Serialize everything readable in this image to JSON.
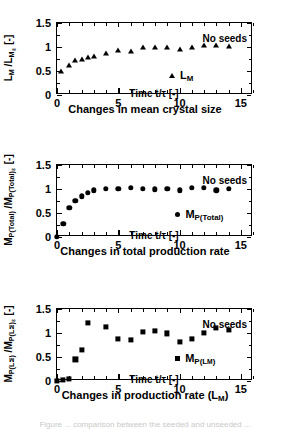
{
  "figure": {
    "width": 290,
    "height": 428,
    "background": "#ffffff",
    "ink_color": "#000000",
    "footnote_partial": "Figure ... comparison between the seeded and unseeded ..."
  },
  "chart_data": [
    {
      "id": "mean-crystal-size",
      "type": "scatter",
      "title": "",
      "caption": "Changes in mean crystal size",
      "xlabel": "Time  t/τ  [-]",
      "ylabel": "L_M /L_M∞ [-]",
      "ylabel_parts": {
        "num": "L",
        "num_sub": "M",
        "den": "L",
        "den_sub": "M∞",
        "units": "[-]"
      },
      "annotation": "No seeds",
      "legend": [
        {
          "label": "L_M",
          "marker": "triangle"
        }
      ],
      "legend_parts": {
        "base": "L",
        "sub": "M"
      },
      "marker": "triangle",
      "xlim": [
        0,
        16
      ],
      "ylim": [
        0,
        1.5
      ],
      "xticks": [
        0,
        5,
        10,
        15
      ],
      "xticklabels": [
        "0",
        "5",
        "10",
        "15"
      ],
      "xminor_step": 1,
      "yticks": [
        0,
        0.5,
        1,
        1.5
      ],
      "yticklabels": [
        "0",
        "0.5",
        "1",
        "1.5"
      ],
      "yminor_step": 0.25,
      "grid": false,
      "x": [
        0.35,
        1.0,
        1.5,
        2.0,
        2.5,
        3.0,
        4.0,
        5.0,
        6.0,
        7.0,
        8.0,
        9.0,
        10.0,
        11.0,
        12.0,
        13.0,
        14.0
      ],
      "y": [
        0.5,
        0.62,
        0.73,
        0.75,
        0.79,
        0.82,
        0.88,
        0.93,
        0.92,
        1.0,
        1.01,
        1.01,
        0.96,
        1.0,
        1.04,
        1.04,
        1.03
      ]
    },
    {
      "id": "total-production-rate",
      "type": "scatter",
      "title": "",
      "caption": "Changes in total production rate",
      "xlabel": "Time  t/τ  [-]",
      "ylabel": "M_P(Total) /M_P(Total)∞ [-]",
      "ylabel_parts": {
        "num": "M",
        "num_sub": "P(Total)",
        "den": "M",
        "den_sub": "P(Total)∞",
        "units": "[-]"
      },
      "annotation": "No seeds",
      "legend": [
        {
          "label": "M_P(Total)",
          "marker": "circle"
        }
      ],
      "legend_parts": {
        "base": "M",
        "sub": "P(Total)"
      },
      "marker": "circle",
      "xlim": [
        0,
        16
      ],
      "ylim": [
        0,
        1.5
      ],
      "xticks": [
        0,
        5,
        10,
        15
      ],
      "xticklabels": [
        "0",
        "5",
        "10",
        "15"
      ],
      "xminor_step": 1,
      "yticks": [
        0,
        0.5,
        1,
        1.5
      ],
      "yticklabels": [
        "0",
        "0.5",
        "1",
        "1.5"
      ],
      "yminor_step": 0.25,
      "grid": false,
      "x": [
        0.0,
        0.5,
        1.0,
        1.5,
        2.0,
        2.5,
        3.0,
        4.0,
        5.0,
        6.0,
        7.0,
        8.0,
        9.0,
        10.0,
        11.0,
        12.0,
        13.0,
        14.0
      ],
      "y": [
        0.0,
        0.28,
        0.61,
        0.75,
        0.85,
        0.92,
        0.97,
        1.0,
        1.0,
        1.02,
        1.0,
        0.99,
        1.0,
        0.97,
        1.03,
        1.02,
        0.97,
        1.01
      ]
    },
    {
      "id": "production-rate-lm",
      "type": "scatter",
      "title": "",
      "caption": "Changes in production rate (L_M)",
      "caption_parts": {
        "text": "Changes in production rate (L",
        "sub": "M",
        "tail": ")"
      },
      "xlabel": "Time  t/τ  [-]",
      "ylabel": "M_P(LM) /M_P(LM)∞ [-]",
      "ylabel_parts": {
        "num": "M",
        "num_sub": "P(LM)",
        "den": "M",
        "den_sub": "P(LM)∞",
        "units": "[-]"
      },
      "annotation": "No seeds",
      "legend": [
        {
          "label": "M_P(LM)",
          "marker": "square"
        }
      ],
      "legend_parts": {
        "base": "M",
        "sub": "P(L",
        "sub_tail": "M)"
      },
      "marker": "square",
      "xlim": [
        0,
        16
      ],
      "ylim": [
        0,
        1.5
      ],
      "xticks": [
        0,
        5,
        10,
        15
      ],
      "xticklabels": [
        "0",
        "5",
        "10",
        "15"
      ],
      "xminor_step": 1,
      "yticks": [
        0,
        0.5,
        1,
        1.5
      ],
      "yticklabels": [
        "0",
        "0.5",
        "1",
        "1.5"
      ],
      "yminor_step": 0.25,
      "grid": false,
      "x": [
        0.0,
        0.5,
        1.0,
        1.5,
        2.0,
        2.5,
        4.0,
        5.0,
        6.0,
        7.0,
        8.0,
        9.0,
        10.0,
        11.0,
        12.0,
        13.0,
        14.0
      ],
      "y": [
        0.01,
        0.03,
        0.05,
        0.45,
        0.65,
        1.21,
        1.13,
        0.88,
        0.85,
        1.02,
        1.04,
        0.99,
        0.81,
        0.87,
        1.0,
        1.1,
        1.07
      ]
    }
  ]
}
